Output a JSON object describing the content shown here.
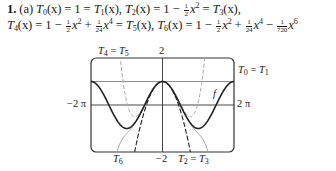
{
  "problem": {
    "number": "1.",
    "part": "(a)",
    "line1": {
      "t0": "T",
      "t0_sub": "0",
      "arg": "(x) = 1 = ",
      "t1": "T",
      "t1_sub": "1",
      "t1_tail": "(x), ",
      "t2": "T",
      "t2_sub": "2",
      "t2_mid": "(x) = 1 − ",
      "frac_half": {
        "num": "1",
        "den": "2"
      },
      "x2": "x",
      "x2_pow": "2",
      "eq": " = ",
      "t3": "T",
      "t3_sub": "3",
      "t3_tail": "(x),"
    },
    "line2": {
      "t4": "T",
      "t4_sub": "4",
      "t4_mid": "(x) = 1 − ",
      "frac_half": {
        "num": "1",
        "den": "2"
      },
      "x": "x",
      "pow2": "2",
      "plus": " + ",
      "frac_24": {
        "num": "1",
        "den": "24"
      },
      "pow4": "4",
      "eq": " = ",
      "t5": "T",
      "t5_sub": "5",
      "t5_tail": "(x), ",
      "t6": "T",
      "t6_sub": "6",
      "t6_mid": "(x) = 1 − ",
      "minus": " − ",
      "frac_720": {
        "num": "1",
        "den": "720"
      },
      "pow6": "6"
    }
  },
  "chart_data": {
    "type": "line",
    "title": "",
    "xlabel": "",
    "ylabel": "",
    "xlim": [
      "-2π",
      "2π"
    ],
    "ylim": [
      -2,
      2
    ],
    "axis_labels": {
      "x_left": "−2 π",
      "x_right": "2 π",
      "y_top": "2",
      "y_bottom": "−2"
    },
    "gridline_y": 1,
    "series": [
      {
        "name": "f",
        "expr": "cos x",
        "style": "solid-thick"
      },
      {
        "name": "T0 = T1",
        "expr": "1",
        "style": "solid-thin"
      },
      {
        "name": "T2 = T3",
        "expr": "1 − x²/2",
        "style": "dashed-dark"
      },
      {
        "name": "T4 = T5",
        "expr": "1 − x²/2 + x⁴/24",
        "style": "dashed-gray"
      },
      {
        "name": "T6",
        "expr": "1 − x²/2 + x⁴/24 − x⁶/720",
        "style": "solid-gray"
      }
    ],
    "annotations": [
      {
        "text": "T4 = T5",
        "position": "top-left"
      },
      {
        "text": "T0 = T1",
        "position": "top-right"
      },
      {
        "text": "f",
        "position": "right"
      },
      {
        "text": "T6",
        "position": "bottom-left"
      },
      {
        "text": "T2 = T3",
        "position": "bottom-center"
      }
    ]
  },
  "labels": {
    "t45": {
      "a": "T",
      "as": "4",
      "eq": " = ",
      "b": "T",
      "bs": "5"
    },
    "t01": {
      "a": "T",
      "as": "0",
      "eq": " = ",
      "b": "T",
      "bs": "1"
    },
    "t23": {
      "a": "T",
      "as": "2",
      "eq": " = ",
      "b": "T",
      "bs": "3"
    },
    "t6": {
      "a": "T",
      "as": "6"
    },
    "f": "f",
    "y_top": "2",
    "y_bottom": "−2",
    "x_left": "−2 π",
    "x_right": "2 π"
  }
}
